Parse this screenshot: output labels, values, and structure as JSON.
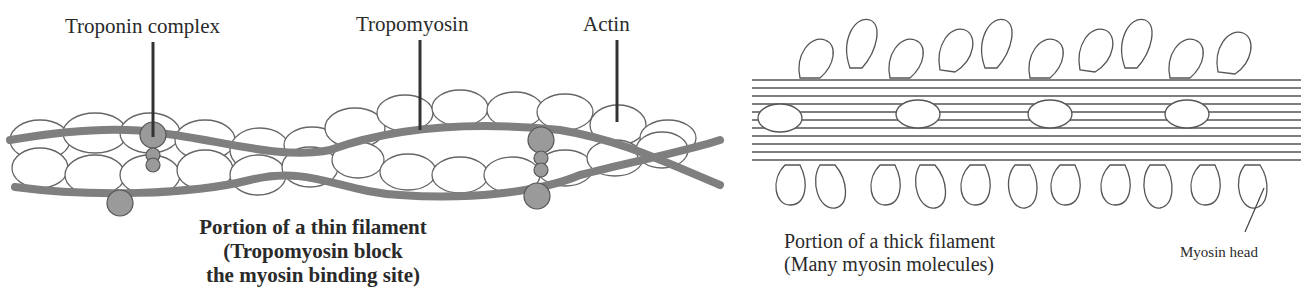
{
  "thin_filament": {
    "labels": {
      "troponin": "Troponin complex",
      "tropomyosin": "Tropomyosin",
      "actin": "Actin"
    },
    "caption": {
      "line1": "Portion of  a thin filament",
      "line2": "(Tropomyosin block",
      "line3": "the myosin binding site)"
    },
    "colors": {
      "strand": "#8a8a8a",
      "troponin": "#9a9a9a",
      "actin_fill": "#ffffff",
      "outline": "#555555"
    }
  },
  "thick_filament": {
    "caption": {
      "line1": "Portion of a thick filament",
      "line2": "(Many myosin molecules)"
    },
    "labels": {
      "myosin_head": "Myosin head"
    }
  }
}
